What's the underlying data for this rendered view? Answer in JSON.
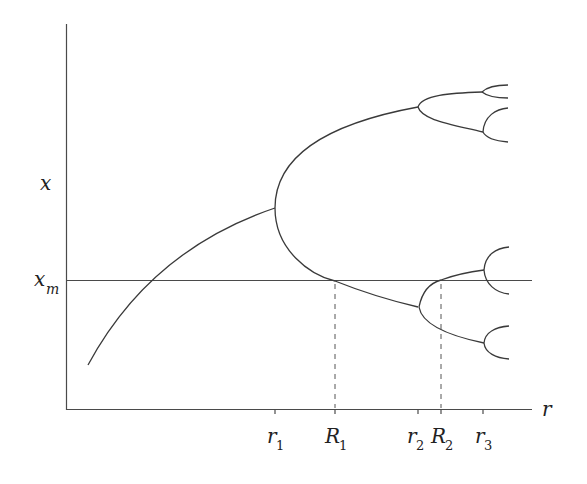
{
  "diagram": {
    "type": "bifurcation-diagram",
    "axes": {
      "x_label": "r",
      "y_label": "x",
      "y_marker": {
        "base": "x",
        "sub": "m"
      }
    },
    "x_ticks": [
      {
        "base": "r",
        "sub": "1"
      },
      {
        "base": "R",
        "sub": "1"
      },
      {
        "base": "r",
        "sub": "2"
      },
      {
        "base": "R",
        "sub": "2"
      },
      {
        "base": "r",
        "sub": "3"
      }
    ],
    "stroke_color": "#3a3a3a",
    "background": "#ffffff"
  }
}
